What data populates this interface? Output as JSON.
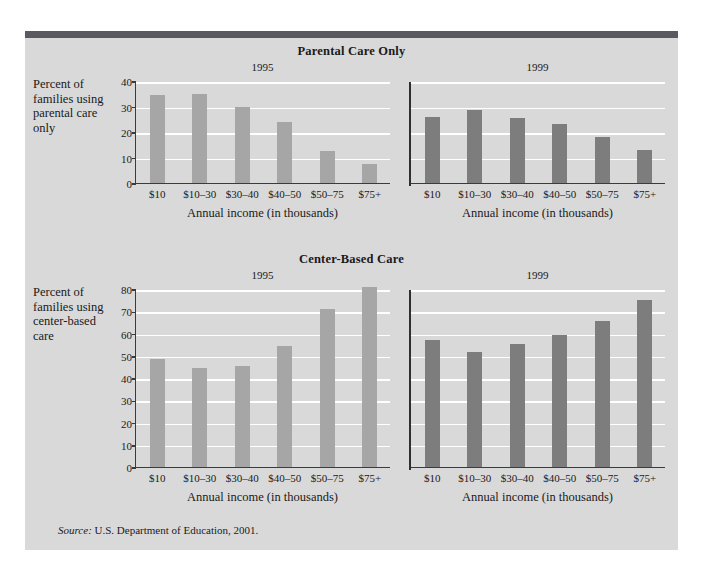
{
  "figure": {
    "source_prefix": "Source:",
    "source_text": "U.S. Department of Education, 2001."
  },
  "charts": [
    {
      "title": "Parental Care Only",
      "y_caption": "Percent of families using parental care only",
      "x_caption_left": "Annual income (in thousands)",
      "x_caption_right": "Annual income (in thousands)",
      "panel_left_label": "1995",
      "panel_right_label": "1999"
    },
    {
      "title": "Center-Based Care",
      "y_caption": "Percent of families using center-based care",
      "x_caption_left": "Annual income (in thousands)",
      "x_caption_right": "Annual income (in thousands)",
      "panel_left_label": "1995",
      "panel_right_label": "1999"
    }
  ],
  "chart_data": [
    {
      "type": "bar",
      "title": "Parental Care Only",
      "xlabel": "Annual income (in thousands)",
      "ylabel": "Percent of families using parental care only",
      "ylim": [
        0,
        40
      ],
      "yticks": [
        0,
        10,
        20,
        30,
        40
      ],
      "grid": true,
      "legend": "none",
      "categories": [
        "$10",
        "$10–30",
        "$30–40",
        "$40–50",
        "$50–75",
        "$75+"
      ],
      "series": [
        {
          "name": "1995",
          "color": "#a6a6a6",
          "values": [
            34.5,
            35.0,
            30.0,
            24.0,
            12.5,
            7.5
          ]
        },
        {
          "name": "1999",
          "color": "#7d7d7d",
          "values": [
            26.0,
            28.5,
            25.5,
            23.0,
            18.0,
            13.0
          ]
        }
      ]
    },
    {
      "type": "bar",
      "title": "Center-Based Care",
      "xlabel": "Annual income (in thousands)",
      "ylabel": "Percent of families using center-based care",
      "ylim": [
        0,
        80
      ],
      "yticks": [
        0,
        10,
        20,
        30,
        40,
        50,
        60,
        70,
        80
      ],
      "grid": true,
      "legend": "none",
      "categories": [
        "$10",
        "$10–30",
        "$30–40",
        "$40–50",
        "$50–75",
        "$75+"
      ],
      "series": [
        {
          "name": "1995",
          "color": "#a6a6a6",
          "values": [
            48.5,
            44.5,
            45.5,
            54.5,
            71.0,
            81.0
          ]
        },
        {
          "name": "1999",
          "color": "#7d7d7d",
          "values": [
            57.0,
            51.5,
            55.5,
            59.5,
            65.5,
            75.0
          ]
        }
      ]
    }
  ]
}
